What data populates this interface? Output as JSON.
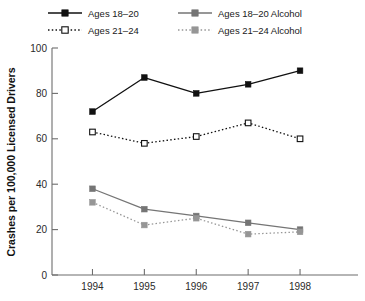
{
  "chart_data": {
    "type": "line",
    "title": "",
    "xlabel": "",
    "ylabel": "Crashes per 100,000 Licensed Drivers",
    "categories": [
      "1994",
      "1995",
      "1996",
      "1997",
      "1998"
    ],
    "x": [
      1994,
      1995,
      1996,
      1997,
      1998
    ],
    "xlim": [
      1993.6,
      1998.5
    ],
    "ylim": [
      0,
      100
    ],
    "yticks": [
      0,
      20,
      40,
      60,
      80,
      100
    ],
    "ytick_labels": [
      "0",
      "20",
      "40",
      "60",
      "80",
      "100"
    ],
    "xtick_labels": [
      "1994",
      "1995",
      "1996",
      "1997",
      "1998"
    ],
    "grid": false,
    "legend_position": "top",
    "series": [
      {
        "name": "Ages 18–20",
        "values": [
          72,
          87,
          80,
          84,
          90
        ],
        "color": "#111111",
        "marker": "filled-square",
        "linestyle": "solid"
      },
      {
        "name": "Ages 21–24",
        "values": [
          63,
          58,
          61,
          67,
          60
        ],
        "color": "#111111",
        "marker": "open-square",
        "linestyle": "dotted"
      },
      {
        "name": "Ages 18–20 Alcohol",
        "values": [
          38,
          29,
          26,
          23,
          20
        ],
        "color": "#757575",
        "marker": "filled-square",
        "linestyle": "solid"
      },
      {
        "name": "Ages 21–24 Alcohol",
        "values": [
          32,
          22,
          25,
          18,
          19
        ],
        "color": "#969696",
        "marker": "filled-square",
        "linestyle": "dotted"
      }
    ]
  },
  "legend": {
    "entries": [
      {
        "label": "Ages 18–20"
      },
      {
        "label": "Ages 18–20 Alcohol"
      },
      {
        "label": "Ages 21–24"
      },
      {
        "label": "Ages 21–24 Alcohol"
      }
    ]
  },
  "axes": {
    "y_title": "Crashes per 100,000 Licensed Drivers"
  },
  "colors": {
    "series_dark": "#111111",
    "series_gray": "#757575",
    "series_gray_light": "#969696",
    "axis": "#6d6d6d",
    "background": "#ffffff"
  }
}
